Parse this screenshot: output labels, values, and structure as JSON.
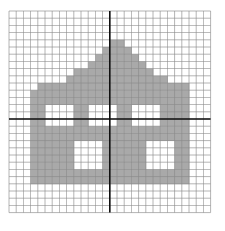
{
  "figure": {
    "type": "grid-pixel-art",
    "grid": {
      "cols": 28,
      "rows": 28,
      "cell_size_px": 7.2,
      "origin_px": [
        8,
        10
      ],
      "major_every": 14,
      "axis_col": 14,
      "axis_row": 15
    },
    "colors": {
      "background": "#ffffff",
      "fill": "#a9a9a9",
      "grid_line": "#8a8a8a",
      "axis_line": "#111111"
    },
    "cells": [
      "............................",
      "............................",
      "............................",
      "............................",
      "..............##............",
      ".............####...........",
      "............######..........",
      "...........########.........",
      ".........###########........",
      "........##############......",
      "....#####################...",
      "...######################...",
      "...######################...",
      "...##....##....##....####...",
      "...##....##....##....####...",
      "...##....##....##....####...",
      "...######################...",
      "...######################...",
      "...######....######....##...",
      "...######....######....##...",
      "...######....######....##...",
      "...######....######....##...",
      "...######################...",
      "...######################...",
      "............................",
      "............................",
      "............................",
      "............................"
    ]
  }
}
